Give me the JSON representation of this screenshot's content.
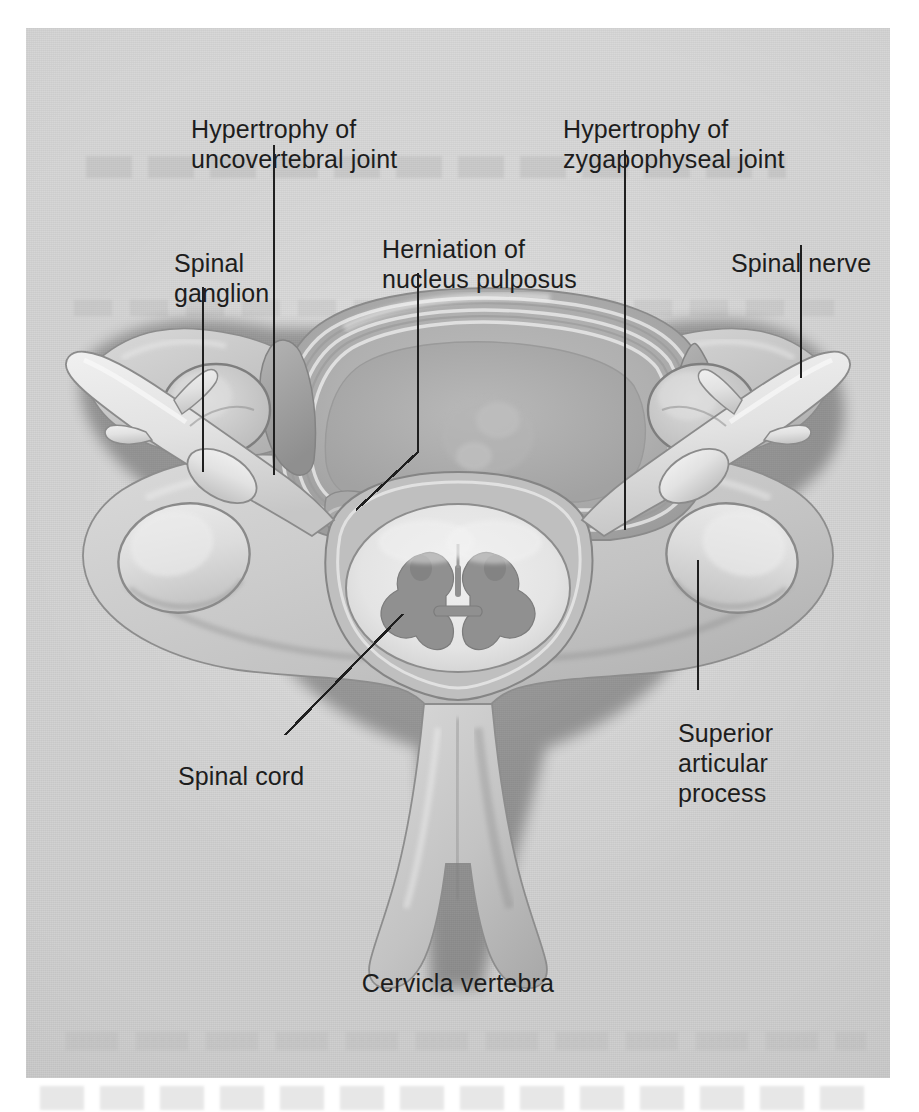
{
  "figure": {
    "caption": "Cervicla vertebra",
    "background_color": "#d3d3d3",
    "ink_color": "#1d1d1d"
  },
  "labels": [
    {
      "id": "hypertrophy-uncovertebral",
      "text": "Hypertrophy of\nuncovertebral joint"
    },
    {
      "id": "hypertrophy-zygapophyseal",
      "text": "Hypertrophy of\nzygapophyseal joint"
    },
    {
      "id": "herniation",
      "text": "Herniation of\nnucleus pulposus"
    },
    {
      "id": "spinal-ganglion",
      "text": "Spinal\nganglion"
    },
    {
      "id": "spinal-nerve",
      "text": "Spinal nerve"
    },
    {
      "id": "spinal-cord",
      "text": "Spinal cord"
    },
    {
      "id": "superior-articular",
      "text": "Superior\narticular\nprocess"
    }
  ],
  "leader_lines": [
    {
      "id": "leader-uncovertebral",
      "type": "vertical",
      "from": [
        248,
        117
      ],
      "to": [
        248,
        447
      ]
    },
    {
      "id": "leader-zygapophyseal",
      "type": "vertical",
      "from": [
        599,
        122
      ],
      "to": [
        599,
        502
      ]
    },
    {
      "id": "leader-herniation",
      "type": "bent",
      "from": [
        392,
        245
      ],
      "bend": [
        392,
        424
      ],
      "to": [
        330,
        482
      ]
    },
    {
      "id": "leader-ganglion",
      "type": "vertical",
      "from": [
        177,
        259
      ],
      "to": [
        177,
        444
      ]
    },
    {
      "id": "leader-nerve",
      "type": "vertical",
      "from": [
        775,
        217
      ],
      "to": [
        775,
        350
      ]
    },
    {
      "id": "leader-cord",
      "type": "diagonal",
      "from": [
        377,
        586
      ],
      "to": [
        259,
        707
      ]
    },
    {
      "id": "leader-superior",
      "type": "vertical",
      "from": [
        672,
        532
      ],
      "to": [
        672,
        662
      ]
    }
  ],
  "anatomy_parts": [
    {
      "id": "vertebral-body",
      "name": "vertebral body"
    },
    {
      "id": "annulus-fibrosus",
      "name": "annulus fibrosus rings"
    },
    {
      "id": "herniated-nucleus",
      "name": "herniated nucleus pulposus"
    },
    {
      "id": "spinal-cord-section",
      "name": "spinal cord"
    },
    {
      "id": "gray-matter",
      "name": "butterfly gray matter"
    },
    {
      "id": "transverse-foramen-left",
      "name": "left transverse foramen"
    },
    {
      "id": "transverse-foramen-right",
      "name": "right transverse foramen"
    },
    {
      "id": "spinal-nerve-left",
      "name": "left spinal nerve"
    },
    {
      "id": "spinal-nerve-right",
      "name": "right spinal nerve"
    },
    {
      "id": "superior-articular-left",
      "name": "left superior articular process"
    },
    {
      "id": "superior-articular-right",
      "name": "right superior articular process"
    },
    {
      "id": "spinous-process",
      "name": "bifid spinous process"
    },
    {
      "id": "lamina-left",
      "name": "left lamina"
    },
    {
      "id": "lamina-right",
      "name": "right lamina"
    }
  ]
}
